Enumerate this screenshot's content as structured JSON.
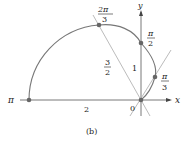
{
  "figure": {
    "caption": "(b)",
    "axes": {
      "x_label": "x",
      "y_label": "y",
      "origin_label": "0"
    },
    "points": [
      {
        "name": "pi",
        "label_num": "π",
        "label_den": ""
      },
      {
        "name": "two-pi-over-three",
        "label_num": "2π",
        "label_den": "3"
      },
      {
        "name": "pi-over-two",
        "label_num": "π",
        "label_den": "2"
      },
      {
        "name": "pi-over-three",
        "label_num": "π",
        "label_den": "3"
      }
    ],
    "segment_labels": {
      "pi_segment": "2",
      "two_pi_over_three_segment_num": "3",
      "two_pi_over_three_segment_den": "2",
      "pi_over_two_segment": "1"
    },
    "colors": {
      "curve": "#777777",
      "lines": "#9a9a9a",
      "points": "#666666",
      "axes": "#444444",
      "text": "#222222"
    }
  }
}
